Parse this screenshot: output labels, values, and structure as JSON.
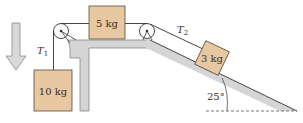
{
  "diagram": {
    "type": "pulley-incline-system",
    "blocks": [
      {
        "id": "hanging",
        "label": "10 kg"
      },
      {
        "id": "table",
        "label": "5 kg"
      },
      {
        "id": "incline",
        "label": "3 kg"
      }
    ],
    "tensions": [
      {
        "id": "T1",
        "symbol": "T",
        "subscript": "1"
      },
      {
        "id": "T2",
        "symbol": "T",
        "subscript": "2"
      }
    ],
    "angle": {
      "label": "25°",
      "value": 25
    },
    "motion_arrow": {
      "direction": "down",
      "icon": "down-arrow-icon"
    },
    "colors": {
      "block_fill": "#e8c8a0",
      "block_stroke": "#5a4a3a",
      "surface_fill": "#d4d5d6",
      "surface_stroke": "#6b6b6b",
      "rope": "#333333",
      "arrow_fill": "#d8d9da",
      "arrow_stroke": "#8a8a8a"
    }
  }
}
